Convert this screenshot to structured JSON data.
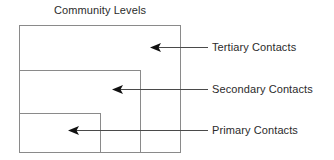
{
  "title": "Community Levels",
  "colors": {
    "background": "#ffffff",
    "stroke": "#8a8a8a",
    "leader_line": "#4a4a4a",
    "text": "#2b2b2b"
  },
  "boxes": [
    {
      "name": "tertiary-contacts-box",
      "label_ref": "Tertiary Contacts",
      "x": 19,
      "y": 25,
      "width": 161,
      "height": 127
    },
    {
      "name": "secondary-contacts-box",
      "label_ref": "Secondary Contacts",
      "x": 19,
      "y": 70,
      "width": 121,
      "height": 82
    },
    {
      "name": "primary-contacts-box",
      "label_ref": "Primary Contacts",
      "x": 19,
      "y": 113,
      "width": 81,
      "height": 39
    }
  ],
  "callouts": [
    {
      "id": "tertiary",
      "label": "Tertiary Contacts",
      "arrow_tip_x": 150,
      "arrow_tip_y": 47,
      "line_end_x": 208
    },
    {
      "id": "secondary",
      "label": "Secondary Contacts",
      "arrow_tip_x": 112,
      "arrow_tip_y": 89,
      "line_end_x": 208
    },
    {
      "id": "primary",
      "label": "Primary Contacts",
      "arrow_tip_x": 68,
      "arrow_tip_y": 130,
      "line_end_x": 208
    }
  ]
}
